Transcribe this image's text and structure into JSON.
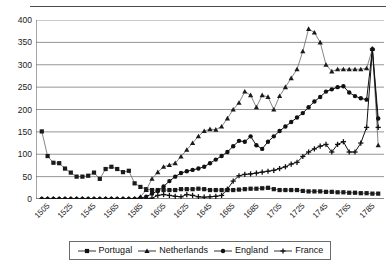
{
  "chart_data": {
    "type": "line",
    "title": "",
    "xlabel": "",
    "ylabel": "",
    "xlim": [
      1500,
      1800
    ],
    "ylim": [
      0,
      400
    ],
    "grid": true,
    "legend_position": "bottom",
    "y_ticks": [
      0,
      50,
      100,
      150,
      200,
      250,
      300,
      350,
      400
    ],
    "x_ticks": [
      1505,
      1525,
      1545,
      1565,
      1585,
      1605,
      1625,
      1645,
      1665,
      1685,
      1705,
      1725,
      1745,
      1765,
      1785
    ],
    "x_minor_step": 5,
    "x": [
      1505,
      1510,
      1515,
      1520,
      1525,
      1530,
      1535,
      1540,
      1545,
      1550,
      1555,
      1560,
      1565,
      1570,
      1575,
      1580,
      1585,
      1590,
      1595,
      1600,
      1605,
      1610,
      1615,
      1620,
      1625,
      1630,
      1635,
      1640,
      1645,
      1650,
      1655,
      1660,
      1665,
      1670,
      1675,
      1680,
      1685,
      1690,
      1695,
      1700,
      1705,
      1710,
      1715,
      1720,
      1725,
      1730,
      1735,
      1740,
      1745,
      1750,
      1755,
      1760,
      1765,
      1770,
      1775,
      1780,
      1785,
      1790,
      1795
    ],
    "series": [
      {
        "name": "Portugal",
        "marker": "square",
        "color": "#1a1a1a",
        "values": [
          151,
          96,
          81,
          80,
          68,
          59,
          50,
          50,
          52,
          59,
          45,
          67,
          72,
          67,
          60,
          63,
          35,
          27,
          22,
          20,
          20,
          20,
          20,
          20,
          22,
          22,
          22,
          23,
          22,
          20,
          20,
          20,
          20,
          20,
          21,
          22,
          23,
          23,
          24,
          25,
          22,
          20,
          20,
          20,
          20,
          18,
          17,
          17,
          17,
          16,
          16,
          15,
          15,
          14,
          14,
          13,
          13,
          12,
          12
        ]
      },
      {
        "name": "Netherlands",
        "marker": "triangle",
        "color": "#1a1a1a",
        "values": [
          0,
          0,
          0,
          0,
          0,
          0,
          0,
          0,
          0,
          0,
          0,
          0,
          0,
          0,
          0,
          0,
          0,
          5,
          20,
          45,
          60,
          72,
          76,
          80,
          95,
          110,
          125,
          140,
          152,
          156,
          155,
          162,
          180,
          200,
          215,
          240,
          232,
          205,
          232,
          228,
          200,
          230,
          250,
          270,
          290,
          330,
          380,
          372,
          350,
          300,
          285,
          290,
          290,
          290,
          290,
          290,
          292,
          335,
          120
        ]
      },
      {
        "name": "England",
        "marker": "circle",
        "color": "#111111",
        "values": [
          0,
          0,
          0,
          0,
          0,
          0,
          0,
          0,
          0,
          0,
          0,
          0,
          0,
          0,
          0,
          0,
          0,
          2,
          5,
          12,
          18,
          28,
          40,
          50,
          58,
          62,
          65,
          68,
          72,
          80,
          88,
          96,
          105,
          118,
          130,
          128,
          140,
          120,
          112,
          128,
          140,
          152,
          162,
          172,
          182,
          192,
          205,
          218,
          228,
          240,
          245,
          250,
          252,
          238,
          230,
          225,
          222,
          335,
          180
        ]
      },
      {
        "name": "France",
        "marker": "plus",
        "color": "#111111",
        "values": [
          0,
          0,
          0,
          0,
          0,
          0,
          0,
          0,
          0,
          0,
          0,
          0,
          0,
          0,
          0,
          0,
          0,
          0,
          0,
          2,
          8,
          10,
          8,
          6,
          5,
          10,
          8,
          5,
          4,
          5,
          6,
          8,
          22,
          40,
          52,
          55,
          56,
          58,
          60,
          62,
          64,
          68,
          72,
          78,
          82,
          95,
          105,
          112,
          118,
          122,
          105,
          122,
          128,
          105,
          105,
          125,
          160,
          335,
          160
        ]
      }
    ]
  },
  "legend": {
    "items": [
      {
        "label": "Portugal",
        "marker": "square"
      },
      {
        "label": "Netherlands",
        "marker": "triangle"
      },
      {
        "label": "England",
        "marker": "circle"
      },
      {
        "label": "France",
        "marker": "plus"
      }
    ]
  }
}
